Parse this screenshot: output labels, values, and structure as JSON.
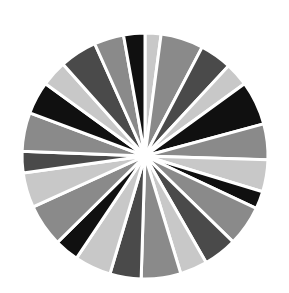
{
  "figure": {
    "background_color": "#ffffff",
    "width": 289,
    "height": 293,
    "title": "",
    "subtitle": ""
  },
  "palette": {
    "light_gray": "#c8c8c8",
    "medium_gray": "#8a8a8a",
    "dark_gray": "#4a4a4a",
    "black": "#101010",
    "separator": "#ffffff"
  },
  "chart_data": {
    "type": "pie",
    "title": "",
    "xlabel": "",
    "ylabel": "",
    "legend_position": "none",
    "grid": false,
    "center_x": 145,
    "center_y": 156,
    "radius": 123,
    "start_angle_deg": -90,
    "direction": "clockwise",
    "separator_color": "#ffffff",
    "separator_width_px": 3,
    "total": 100,
    "categories": [
      "S1",
      "S2",
      "S3",
      "S4",
      "S5",
      "S6",
      "S7",
      "S8",
      "S9",
      "S10",
      "S11",
      "S12",
      "S13",
      "S14",
      "S15",
      "S16",
      "S17",
      "S18",
      "S19",
      "S20",
      "S21",
      "S22",
      "S23",
      "S24"
    ],
    "values": [
      2.1,
      5.6,
      4.2,
      3.1,
      5.8,
      4.7,
      4.2,
      2.3,
      5.3,
      4.4,
      3.6,
      5.2,
      4.1,
      4.8,
      3.2,
      5.6,
      4.6,
      2.8,
      5.1,
      4.3,
      3.4,
      4.9,
      3.9,
      2.8
    ],
    "colors": [
      "#c8c8c8",
      "#8a8a8a",
      "#4a4a4a",
      "#c8c8c8",
      "#101010",
      "#8a8a8a",
      "#c8c8c8",
      "#101010",
      "#8a8a8a",
      "#4a4a4a",
      "#c8c8c8",
      "#8a8a8a",
      "#4a4a4a",
      "#c8c8c8",
      "#101010",
      "#8a8a8a",
      "#c8c8c8",
      "#4a4a4a",
      "#8a8a8a",
      "#101010",
      "#c8c8c8",
      "#4a4a4a",
      "#8a8a8a",
      "#101010"
    ]
  }
}
